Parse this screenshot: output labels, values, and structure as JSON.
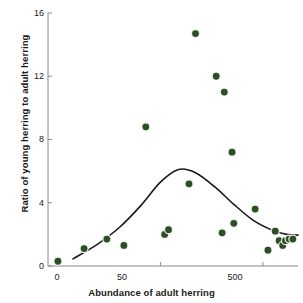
{
  "chart_data": {
    "type": "scatter",
    "title": "",
    "xlabel": "Abundance of adult herring",
    "ylabel": "Ratio of young herring to adult herring",
    "xscale": "log",
    "xlim": [
      4,
      1100
    ],
    "ylim": [
      0,
      16
    ],
    "xticks": [
      {
        "value": 5,
        "label": "0"
      },
      {
        "value": 50,
        "label": "50"
      },
      {
        "value": 500,
        "label": "500"
      }
    ],
    "yticks": [
      {
        "value": 0,
        "label": "0"
      },
      {
        "value": 4,
        "label": "4"
      },
      {
        "value": 8,
        "label": "8"
      },
      {
        "value": 12,
        "label": "12"
      },
      {
        "value": 16,
        "label": "16"
      }
    ],
    "grid": false,
    "legend": "none",
    "point_color": "#2d4d2a",
    "point_edge_color": "#eef2e2",
    "curve_color": "#1a1a1a",
    "axis_color": "#8a8a8a",
    "points": [
      {
        "x": 5,
        "y": 0.3
      },
      {
        "x": 9,
        "y": 1.1
      },
      {
        "x": 15,
        "y": 1.7
      },
      {
        "x": 22,
        "y": 1.3
      },
      {
        "x": 36,
        "y": 8.8
      },
      {
        "x": 55,
        "y": 2.0
      },
      {
        "x": 60,
        "y": 2.3
      },
      {
        "x": 95,
        "y": 5.2
      },
      {
        "x": 110,
        "y": 14.7
      },
      {
        "x": 175,
        "y": 12.0
      },
      {
        "x": 210,
        "y": 11.0
      },
      {
        "x": 250,
        "y": 7.2
      },
      {
        "x": 260,
        "y": 2.7
      },
      {
        "x": 200,
        "y": 2.1
      },
      {
        "x": 420,
        "y": 3.6
      },
      {
        "x": 560,
        "y": 1.0
      },
      {
        "x": 660,
        "y": 2.2
      },
      {
        "x": 720,
        "y": 1.6
      },
      {
        "x": 780,
        "y": 1.3
      },
      {
        "x": 830,
        "y": 1.6
      },
      {
        "x": 900,
        "y": 1.7
      },
      {
        "x": 980,
        "y": 1.7
      }
    ],
    "curve": {
      "label": "fitted stock-recruitment curve",
      "peak_x": 75,
      "peak_y": 6.1,
      "x": [
        7,
        12,
        20,
        32,
        50,
        75,
        110,
        170,
        260,
        400,
        600,
        850,
        1100
      ],
      "y": [
        0.45,
        1.35,
        2.45,
        3.8,
        5.3,
        6.1,
        5.9,
        5.0,
        3.9,
        2.9,
        2.3,
        2.0,
        1.95
      ]
    }
  }
}
